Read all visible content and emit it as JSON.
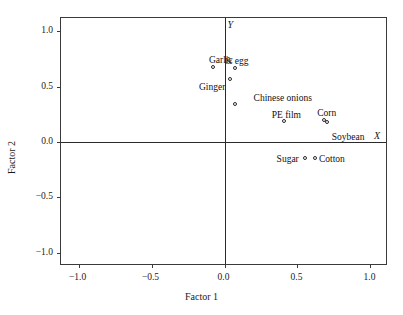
{
  "chart_data": {
    "type": "scatter",
    "title": "",
    "xlabel": "Factor 1",
    "ylabel": "Factor 2",
    "xlim": [
      -1.12,
      1.12
    ],
    "ylim": [
      -1.12,
      1.12
    ],
    "xticks": [
      "-1.0",
      "-0.5",
      "0.0",
      "0.5",
      "1.0"
    ],
    "xtick_values": [
      -1.0,
      -0.5,
      0.0,
      0.5,
      1.0
    ],
    "yticks": [
      "1.0",
      "0.5",
      "0.0",
      "-0.5",
      "-1.0"
    ],
    "ytick_values": [
      1.0,
      0.5,
      0.0,
      -0.5,
      -1.0
    ],
    "grid": false,
    "legend": "none",
    "axis_letters": {
      "x": "X",
      "y": "Y"
    },
    "points": [
      {
        "label": "Garlic",
        "x": -0.08,
        "y": 0.68,
        "label_pos": "above-center",
        "label_dx": 8,
        "label_dy": -11
      },
      {
        "label": "& egg",
        "x": 0.07,
        "y": 0.67,
        "label_pos": "above-center",
        "label_dx": 2,
        "label_dy": -11
      },
      {
        "label": "Ginger",
        "x": 0.04,
        "y": 0.57,
        "label_pos": "left",
        "label_dx": -5,
        "label_dy": 4
      },
      {
        "label": "Chinese onions",
        "x": 0.07,
        "y": 0.34,
        "label_pos": "above-center",
        "label_dx": 48,
        "label_dy": -10
      },
      {
        "label": "PE film",
        "x": 0.41,
        "y": 0.19,
        "label_pos": "above-center",
        "label_dx": 2,
        "label_dy": -10
      },
      {
        "label": "Corn",
        "x": 0.68,
        "y": 0.2,
        "label_pos": "above-center",
        "label_dx": 3,
        "label_dy": -11
      },
      {
        "label": "Soybean",
        "x": 0.7,
        "y": 0.18,
        "label_pos": "right",
        "label_dx": 5,
        "label_dy": 11
      },
      {
        "label": "Sugar",
        "x": 0.55,
        "y": -0.14,
        "label_pos": "left",
        "label_dx": -6,
        "label_dy": -3
      },
      {
        "label": "Cotton",
        "x": 0.62,
        "y": -0.14,
        "label_pos": "right",
        "label_dx": 4,
        "label_dy": -3
      }
    ]
  }
}
